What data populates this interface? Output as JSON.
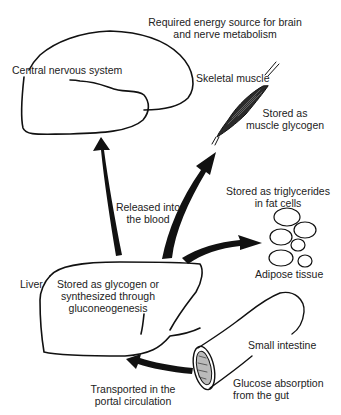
{
  "diagram": {
    "nodes": {
      "cns": {
        "label": "Central nervous system",
        "note": "Required energy source for brain\nand nerve metabolism"
      },
      "muscle": {
        "label": "Skeletal muscle",
        "note": "Stored as\nmuscle glycogen"
      },
      "adipose": {
        "label": "Adipose tissue",
        "note": "Stored as triglycerides\nin fat cells"
      },
      "liver": {
        "label": "Liver",
        "note": "Stored as glycogen or\nsynthesized through\ngluconeogenesis"
      },
      "intestine": {
        "label": "Small intestine",
        "note": "Glucose absorption\nfrom the gut"
      }
    },
    "edges": {
      "liver_to_tissues": "Released into\nthe blood",
      "intestine_to_liver": "Transported in the\nportal circulation"
    },
    "colors": {
      "stroke": "#111111",
      "text": "#222222",
      "background": "#ffffff"
    }
  }
}
